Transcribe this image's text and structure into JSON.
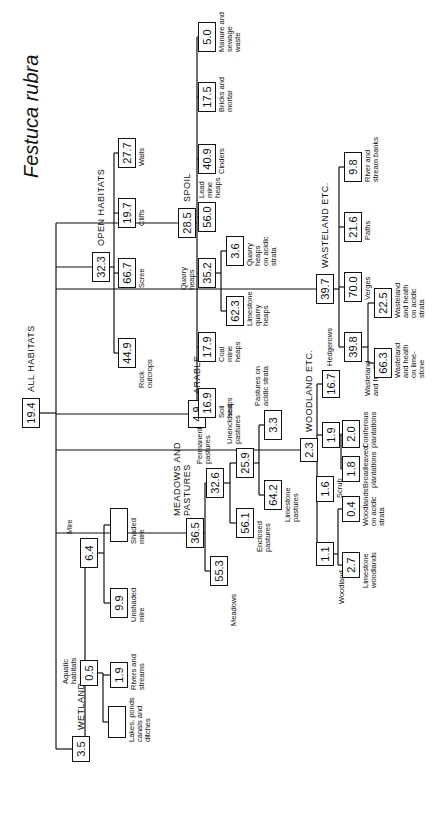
{
  "title": "Festuca rubra",
  "nodes": {
    "all": {
      "value": "19.4",
      "label": "ALL HABITATS"
    },
    "wetland": {
      "value": "3.5",
      "label": "WETLAND"
    },
    "aquatic": {
      "value": "0.5",
      "label": "Aquatic\nhabitats"
    },
    "lakes": {
      "value": "",
      "label": "Lakes, ponds\ncanals and\nditches"
    },
    "rivers": {
      "value": "1.9",
      "label": "Rivers and\nstreams"
    },
    "mire": {
      "value": "6.4",
      "label": "Mire"
    },
    "unshaded_mire": {
      "value": "9.9",
      "label": "Unshaded\nmire"
    },
    "shaded_mire": {
      "value": "",
      "label": "Shaded\nmire"
    },
    "meadows_pastures": {
      "value": "36.5",
      "label": "MEADOWS AND\nPASTURES"
    },
    "meadows": {
      "value": "55.3",
      "label": "Meadows"
    },
    "permanent_pastures": {
      "value": "32.6",
      "label": "Permanent\npastures"
    },
    "enclosed_pastures": {
      "value": "56.1",
      "label": "Enclosed\npastures"
    },
    "unenclosed_pastures": {
      "value": "25.9",
      "label": "Unenclosed\npastures"
    },
    "limestone_pastures": {
      "value": "64.2",
      "label": "Limestone\npastures"
    },
    "pastures_acidic": {
      "value": "3.3",
      "label": "Pastures on\nacidic strata"
    },
    "arable": {
      "value": "4.9",
      "label": "ARABLE"
    },
    "woodland_etc": {
      "value": "2.3",
      "label": "WOODLAND ETC."
    },
    "woodland": {
      "value": "1.1",
      "label": "Woodland"
    },
    "limestone_woodlands": {
      "value": "2.7",
      "label": "Limestone\nwoodlands"
    },
    "woodlands_acidic": {
      "value": "0.4",
      "label": "Woodlands\non acidic\nstrata"
    },
    "scrub": {
      "value": "1.6",
      "label": "Scrub"
    },
    "plantations": {
      "value": "1.9",
      "label": ""
    },
    "broadleaved": {
      "value": "1.8",
      "label": "Broadleaved\nplantations"
    },
    "coniferous": {
      "value": "2.0",
      "label": "Coniferous\nplantations"
    },
    "hedgerows": {
      "value": "16.7",
      "label": "Hedgerows"
    },
    "open_habitats": {
      "value": "32.3",
      "label": "OPEN HABITATS"
    },
    "rock_outcrops": {
      "value": "44.9",
      "label": "Rock\noutcrops"
    },
    "scree": {
      "value": "66.7",
      "label": "Scree"
    },
    "cliffs": {
      "value": "19.7",
      "label": "Cliffs"
    },
    "walls": {
      "value": "27.7",
      "label": "Walls"
    },
    "spoil": {
      "value": "28.5",
      "label": "SPOIL"
    },
    "soil_heaps": {
      "value": "16.9",
      "label": "Soil\nheaps"
    },
    "coal_mine": {
      "value": "17.9",
      "label": "Coal\nmine\nheaps"
    },
    "quarry_heaps": {
      "value": "35.2",
      "label": "Quarry\nheaps"
    },
    "limestone_quarry": {
      "value": "62.3",
      "label": "Limestone\nquarry\nheaps"
    },
    "quarry_acidic": {
      "value": "3.6",
      "label": "Quarry\nheaps\non acidic\nstrata"
    },
    "lead_mine": {
      "value": "56.0",
      "label": "Lead\nmine\nheaps"
    },
    "cinders": {
      "value": "40.9",
      "label": "Cinders"
    },
    "bricks": {
      "value": "17.5",
      "label": "Bricks and\nmortar"
    },
    "manure": {
      "value": "5.0",
      "label": "Manure and\nsewage\nwaste"
    },
    "wasteland_etc": {
      "value": "39.7",
      "label": "WASTELAND ETC."
    },
    "wasteland_heath": {
      "value": "39.8",
      "label": "Wasteland\nand heath"
    },
    "wh_limestone": {
      "value": "66.3",
      "label": "Wasteland\nand heath\non lime-\nstone"
    },
    "wh_acidic": {
      "value": "22.5",
      "label": "Wasteland\nand heath\non acidic\nstrata"
    },
    "verges": {
      "value": "70.0",
      "label": "Verges"
    },
    "paths": {
      "value": "21.6",
      "label": "Paths"
    },
    "river_banks": {
      "value": "9.8",
      "label": "River and\nstream banks"
    }
  }
}
